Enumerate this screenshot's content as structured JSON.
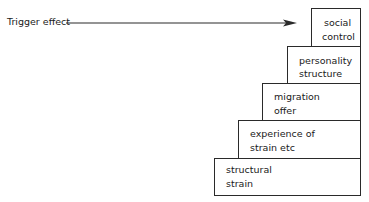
{
  "diagram": {
    "type": "staircase",
    "trigger": {
      "label": "Trigger effect",
      "arrow_direction": "right"
    },
    "steps": [
      {
        "line1": "social",
        "line2": "control"
      },
      {
        "line1": "personality",
        "line2": "structure"
      },
      {
        "line1": "migration",
        "line2": "offer"
      },
      {
        "line1": "experience of",
        "line2": "strain etc"
      },
      {
        "line1": "structural",
        "line2": "strain"
      }
    ],
    "colors": {
      "line": "#2a2a2a",
      "text": "#1a1a1a",
      "background": "#ffffff"
    }
  }
}
